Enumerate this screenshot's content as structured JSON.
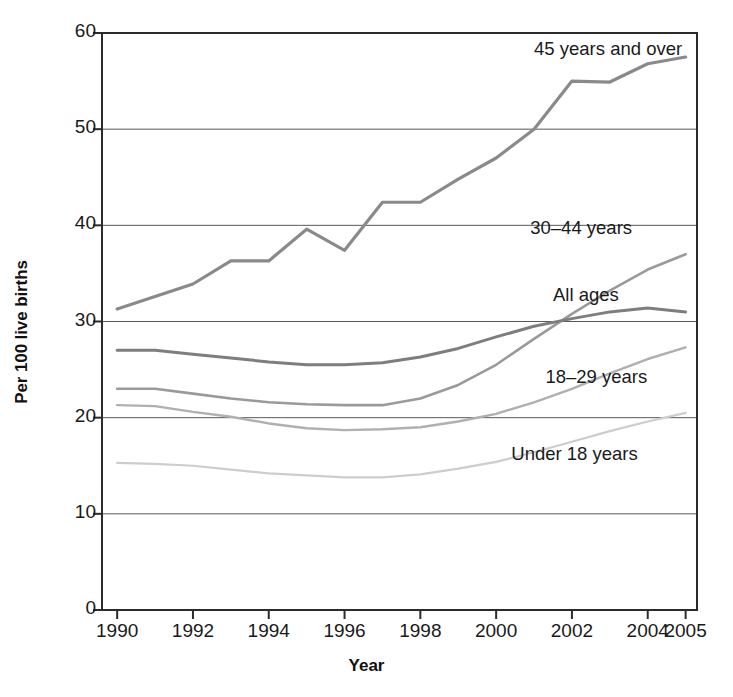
{
  "chart_data": {
    "type": "line",
    "title": "",
    "xlabel": "Year",
    "ylabel": "Per 100 live births",
    "xlim": [
      1989.6,
      2005.3
    ],
    "ylim": [
      0,
      60
    ],
    "grid": true,
    "legend_position": "inline-right",
    "x": [
      1990,
      1991,
      1992,
      1993,
      1994,
      1995,
      1996,
      1997,
      1998,
      1999,
      2000,
      2001,
      2002,
      2003,
      2004,
      2005
    ],
    "xticks": [
      "1990",
      "1992",
      "1994",
      "1996",
      "1998",
      "2000",
      "2002",
      "2004",
      "2005"
    ],
    "xtick_values": [
      1990,
      1992,
      1994,
      1996,
      1998,
      2000,
      2002,
      2004,
      2005
    ],
    "yticks": [
      "0",
      "10",
      "20",
      "30",
      "40",
      "50",
      "60"
    ],
    "ytick_values": [
      0,
      10,
      20,
      30,
      40,
      50,
      60
    ],
    "series": [
      {
        "name": "45 years and over",
        "color": "#8a8a8a",
        "width": 3.2,
        "label_x": 2001.0,
        "label_y": 58.2,
        "values": [
          31.3,
          32.6,
          33.9,
          36.3,
          36.3,
          39.6,
          37.4,
          42.4,
          42.4,
          44.8,
          47.0,
          50.0,
          55.0,
          54.9,
          56.8,
          57.5
        ]
      },
      {
        "name": "30-44 years",
        "color": "#9a9a9a",
        "width": 2.6,
        "label_x": 2000.9,
        "label_y": 39.6,
        "values": [
          23.0,
          23.0,
          22.5,
          22.0,
          21.6,
          21.4,
          21.3,
          21.3,
          22.0,
          23.4,
          25.5,
          28.2,
          30.8,
          33.2,
          35.4,
          37.0
        ]
      },
      {
        "name": "All ages",
        "color": "#7e7e7e",
        "width": 3.0,
        "label_x": 2001.5,
        "label_y": 32.6,
        "values": [
          27.0,
          27.0,
          26.6,
          26.2,
          25.8,
          25.5,
          25.5,
          25.7,
          26.3,
          27.2,
          28.4,
          29.5,
          30.3,
          31.0,
          31.4,
          31.0
        ]
      },
      {
        "name": "18-29 years",
        "color": "#b0b0b0",
        "width": 2.4,
        "label_x": 2001.3,
        "label_y": 24.1,
        "values": [
          21.3,
          21.2,
          20.6,
          20.1,
          19.4,
          18.9,
          18.7,
          18.8,
          19.0,
          19.6,
          20.4,
          21.6,
          23.0,
          24.6,
          26.1,
          27.3
        ]
      },
      {
        "name": "Under 18 years",
        "color": "#cdcdcd",
        "width": 2.2,
        "label_x": 2000.4,
        "label_y": 16.1,
        "values": [
          15.3,
          15.2,
          15.0,
          14.6,
          14.2,
          14.0,
          13.8,
          13.8,
          14.1,
          14.7,
          15.4,
          16.4,
          17.5,
          18.6,
          19.6,
          20.5
        ]
      }
    ]
  }
}
